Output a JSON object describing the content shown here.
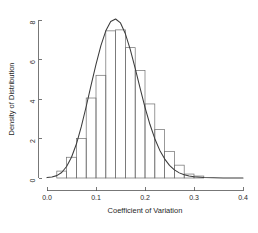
{
  "chart_data": {
    "type": "bar",
    "title": "",
    "xlabel": "Coefficient of Variation",
    "ylabel": "Density of Distribution",
    "xlim": [
      0.0,
      0.4
    ],
    "ylim": [
      0,
      8
    ],
    "xticks": [
      0.0,
      0.1,
      0.2,
      0.3,
      0.4
    ],
    "xtick_labels": [
      "0.0",
      "0.1",
      "0.2",
      "0.3",
      "0.4"
    ],
    "yticks": [
      0,
      2,
      4,
      6,
      8
    ],
    "ytick_labels": [
      "0",
      "2",
      "4",
      "6",
      "8"
    ],
    "grid": false,
    "legend": "none",
    "bin_width": 0.02,
    "bin_edges": [
      0.0,
      0.02,
      0.04,
      0.06,
      0.08,
      0.1,
      0.12,
      0.14,
      0.16,
      0.18,
      0.2,
      0.22,
      0.24,
      0.26,
      0.28,
      0.3,
      0.32,
      0.34,
      0.36,
      0.38,
      0.4
    ],
    "categories": [
      "0.00-0.02",
      "0.02-0.04",
      "0.04-0.06",
      "0.06-0.08",
      "0.08-0.10",
      "0.10-0.12",
      "0.12-0.14",
      "0.14-0.16",
      "0.16-0.18",
      "0.18-0.20",
      "0.20-0.22",
      "0.22-0.24",
      "0.24-0.26",
      "0.26-0.28",
      "0.28-0.30",
      "0.30-0.32",
      "0.32-0.34",
      "0.34-0.36",
      "0.36-0.38",
      "0.38-0.40"
    ],
    "values": [
      0.0,
      0.35,
      1.05,
      2.0,
      4.05,
      5.2,
      7.45,
      7.5,
      6.6,
      5.45,
      3.75,
      2.45,
      1.35,
      0.65,
      0.2,
      0.1,
      0.0,
      0.0,
      0.0,
      0.0
    ],
    "series": [
      {
        "name": "Histogram of Coefficient of Variation",
        "type": "bar",
        "values": [
          0.0,
          0.35,
          1.05,
          2.0,
          4.05,
          5.2,
          7.45,
          7.5,
          6.6,
          5.45,
          3.75,
          2.45,
          1.35,
          0.65,
          0.2,
          0.1,
          0.0,
          0.0,
          0.0,
          0.0
        ]
      },
      {
        "name": "Fitted density curve",
        "type": "line",
        "x": [
          0.0,
          0.01,
          0.02,
          0.03,
          0.04,
          0.05,
          0.06,
          0.07,
          0.08,
          0.09,
          0.1,
          0.11,
          0.12,
          0.13,
          0.14,
          0.15,
          0.16,
          0.17,
          0.18,
          0.19,
          0.2,
          0.21,
          0.22,
          0.23,
          0.24,
          0.25,
          0.26,
          0.27,
          0.28,
          0.29,
          0.3,
          0.32,
          0.34,
          0.36,
          0.38,
          0.4
        ],
        "y": [
          0.02,
          0.05,
          0.12,
          0.28,
          0.58,
          1.05,
          1.72,
          2.6,
          3.62,
          4.7,
          5.75,
          6.7,
          7.45,
          7.92,
          8.05,
          7.85,
          7.3,
          6.5,
          5.55,
          4.55,
          3.58,
          2.72,
          1.99,
          1.41,
          0.97,
          0.64,
          0.41,
          0.26,
          0.16,
          0.1,
          0.06,
          0.02,
          0.01,
          0.0,
          0.0,
          0.0
        ],
        "peak_x": 0.14,
        "peak_y": 8.05
      }
    ],
    "colors": {
      "bar_stroke": "#6e6e6e",
      "bar_fill": "none",
      "curve": "#3b3b3b",
      "axis": "#555555",
      "text": "#1f1f1f",
      "background": "#ffffff"
    }
  }
}
